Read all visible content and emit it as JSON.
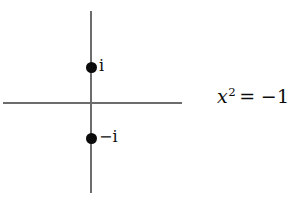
{
  "figure": {
    "type": "complex-plane-diagram",
    "background_color": "#ffffff",
    "axis_color": "#6c6c6c",
    "point_color": "#0b0b0b",
    "text_color": "#0b0b0b"
  },
  "axes": {
    "vertical_label": "",
    "horizontal_label": ""
  },
  "points": [
    {
      "label": "i",
      "name": "point-i",
      "value": "i"
    },
    {
      "label": "−i",
      "name": "point-minus-i",
      "value": "-i"
    }
  ],
  "equation": {
    "base": "x",
    "exponent": "2",
    "operator": "=",
    "result": "−1",
    "full_text": "x² = −1"
  }
}
